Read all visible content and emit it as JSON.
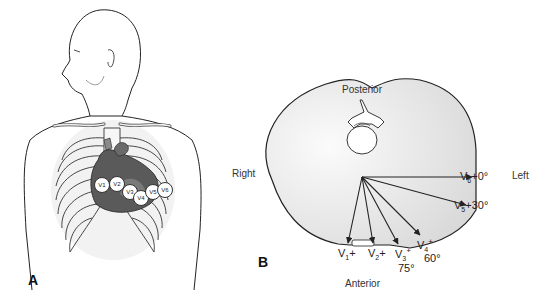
{
  "figure": {
    "panel_a": {
      "letter": "A",
      "description": "Anterior torso with rib cage and heart showing precordial electrode placement",
      "electrodes": [
        {
          "id": "V1",
          "label": "V1"
        },
        {
          "id": "V2",
          "label": "V2"
        },
        {
          "id": "V3",
          "label": "V3"
        },
        {
          "id": "V4",
          "label": "V4"
        },
        {
          "id": "V5",
          "label": "V5"
        },
        {
          "id": "V6",
          "label": "V6"
        }
      ]
    },
    "panel_b": {
      "letter": "B",
      "description": "Transverse cross-section of thorax showing precordial lead axes",
      "orientation": {
        "posterior": "Posterior",
        "anterior": "Anterior",
        "right": "Right",
        "left": "Left"
      },
      "leads": [
        {
          "id": "V1",
          "name": "V",
          "sub": "1",
          "sign": "+",
          "angle": ""
        },
        {
          "id": "V2",
          "name": "V",
          "sub": "2",
          "sign": "+",
          "angle": ""
        },
        {
          "id": "V3",
          "name": "V",
          "sub": "3",
          "sign": "+",
          "angle": "75°"
        },
        {
          "id": "V4",
          "name": "V",
          "sub": "4",
          "sign": "+",
          "angle": "60°"
        },
        {
          "id": "V5",
          "name": "V",
          "sub": "5",
          "sign": "+",
          "angle": "30°"
        },
        {
          "id": "V6",
          "name": "V",
          "sub": "6",
          "sign": "+",
          "angle": "0°"
        }
      ]
    }
  },
  "colors": {
    "line": "#222222",
    "thorax_fill": "#e6e6e6",
    "heart_dark": "#5a5a5a",
    "heart_mid": "#8a8a8a",
    "background": "#ffffff"
  }
}
